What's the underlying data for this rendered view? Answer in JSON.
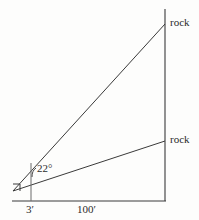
{
  "figure": {
    "stroke_color": "#3a3a3a",
    "text_color": "#2b2b2b",
    "background_color": "#fdfdfc",
    "labels": {
      "rock_upper": "rock",
      "rock_lower": "rock",
      "angle": "22°",
      "base_short": "3′",
      "base_long": "100′"
    },
    "geometry": {
      "origin": [
        13,
        191
      ],
      "baseline_start": [
        12,
        201
      ],
      "baseline_end": [
        166,
        201
      ],
      "vertical_axis_top": [
        165,
        9
      ],
      "vertical_axis_bottom": [
        165,
        201
      ],
      "upper_ray_end": [
        165,
        24
      ],
      "lower_ray_end": [
        165,
        141
      ],
      "tick_3ft_x": 31,
      "tick_3ft_top": 163,
      "tick_3ft_bottom": 201,
      "right_angle_marker_size": 7
    }
  }
}
